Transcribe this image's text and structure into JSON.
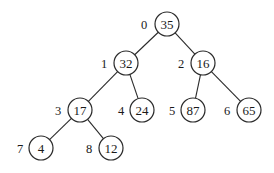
{
  "diagram": {
    "type": "binary-heap-tree",
    "node_radius": 12,
    "nodes": [
      {
        "index": "0",
        "value": "35",
        "x": 167,
        "y": 24,
        "label_x": 144
      },
      {
        "index": "1",
        "value": "32",
        "x": 126,
        "y": 63,
        "label_x": 104
      },
      {
        "index": "2",
        "value": "16",
        "x": 203,
        "y": 63,
        "label_x": 181
      },
      {
        "index": "3",
        "value": "17",
        "x": 80,
        "y": 110,
        "label_x": 58
      },
      {
        "index": "4",
        "value": "24",
        "x": 142,
        "y": 110,
        "label_x": 121
      },
      {
        "index": "5",
        "value": "87",
        "x": 193,
        "y": 110,
        "label_x": 172
      },
      {
        "index": "6",
        "value": "65",
        "x": 249,
        "y": 110,
        "label_x": 227
      },
      {
        "index": "7",
        "value": "4",
        "x": 41,
        "y": 148,
        "label_x": 20
      },
      {
        "index": "8",
        "value": "12",
        "x": 111,
        "y": 148,
        "label_x": 89
      }
    ],
    "edges": [
      {
        "from": 0,
        "to": 1
      },
      {
        "from": 0,
        "to": 2
      },
      {
        "from": 1,
        "to": 3
      },
      {
        "from": 1,
        "to": 4
      },
      {
        "from": 2,
        "to": 5
      },
      {
        "from": 2,
        "to": 6
      },
      {
        "from": 3,
        "to": 7
      },
      {
        "from": 3,
        "to": 8
      }
    ]
  }
}
